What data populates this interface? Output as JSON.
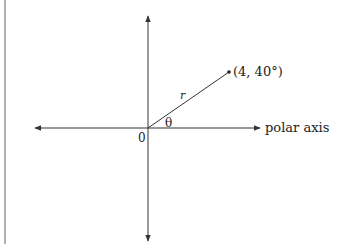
{
  "diagram": {
    "type": "polar-coordinate-diagram",
    "point_label": "(4, 40°)",
    "radius_label": "r",
    "angle_label": "θ",
    "origin_label": "0",
    "axis_label": "polar axis",
    "point": {
      "r": 4,
      "theta_deg": 40
    },
    "colors": {
      "line": "#333333",
      "text": "#222222",
      "border": "#888888"
    }
  }
}
